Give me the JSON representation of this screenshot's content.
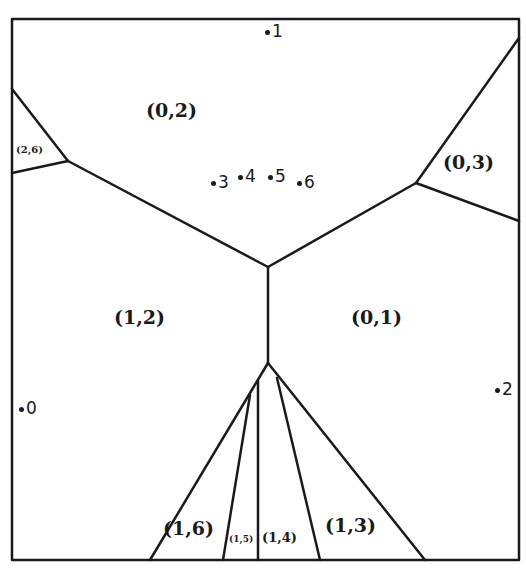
{
  "diagram": {
    "type": "voronoi-partition",
    "line_color": "#1a1a1a",
    "background": "#ffffff",
    "regions": [
      {
        "id": "r02",
        "label": "(0,2)"
      },
      {
        "id": "r26",
        "label": "(2,6)"
      },
      {
        "id": "r03",
        "label": "(0,3)"
      },
      {
        "id": "r12",
        "label": "(1,2)"
      },
      {
        "id": "r01",
        "label": "(0,1)"
      },
      {
        "id": "r16",
        "label": "(1,6)"
      },
      {
        "id": "r15",
        "label": "(1,5)"
      },
      {
        "id": "r14",
        "label": "(1,4)"
      },
      {
        "id": "r13",
        "label": "(1,3)"
      }
    ],
    "points": [
      {
        "id": "p0",
        "label": "0"
      },
      {
        "id": "p1",
        "label": "1"
      },
      {
        "id": "p2",
        "label": "2"
      },
      {
        "id": "p3",
        "label": "3"
      },
      {
        "id": "p4",
        "label": "4"
      },
      {
        "id": "p5",
        "label": "5"
      },
      {
        "id": "p6",
        "label": "6"
      }
    ]
  }
}
